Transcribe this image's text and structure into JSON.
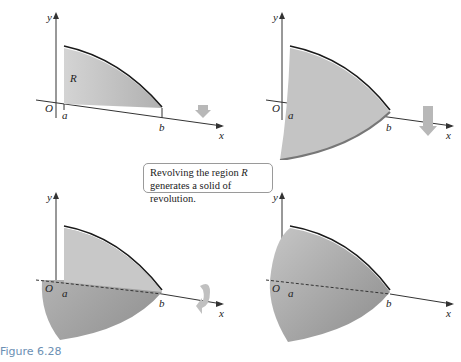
{
  "figure": {
    "label": "Figure 6.28",
    "caption_line1": "Revolving the region ",
    "caption_region": "R",
    "caption_line2": "generates a solid of revolution."
  },
  "panels": [
    {
      "id": "panel-1",
      "description": "Region R under curve between a and b",
      "labels": {
        "y": "y",
        "x": "x",
        "origin": "O",
        "a": "a",
        "b": "b",
        "region": "R"
      }
    },
    {
      "id": "panel-2",
      "description": "Region rotating partially about x-axis",
      "labels": {
        "y": "y",
        "x": "x",
        "origin": "O",
        "a": "a",
        "b": "b"
      }
    },
    {
      "id": "panel-3",
      "description": "Region rotated further forming partial solid",
      "labels": {
        "y": "y",
        "x": "x",
        "origin": "O",
        "a": "a",
        "b": "b"
      }
    },
    {
      "id": "panel-4",
      "description": "Complete solid of revolution",
      "labels": {
        "y": "y",
        "x": "x",
        "origin": "O",
        "a": "a",
        "b": "b"
      }
    }
  ],
  "colors": {
    "region_fill": "#c9c9c9",
    "region_dark": "#a8a8a8",
    "curve": "#1a1a1a",
    "axis": "#333333",
    "arrow": "#b8b8b8",
    "figure_label": "#6b8fb3"
  }
}
